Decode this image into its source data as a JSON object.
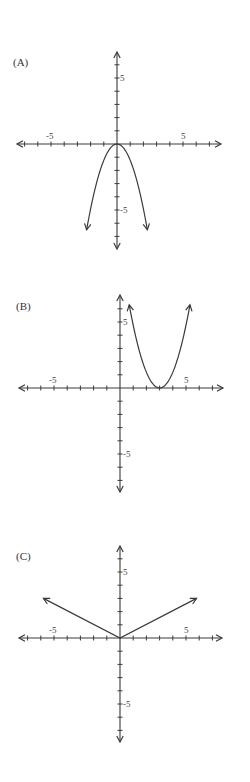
{
  "page": {
    "background": "#ffffff",
    "ink": "#3a3a3a"
  },
  "graphs": [
    {
      "label": "(A)",
      "id": "A"
    },
    {
      "label": "(B)",
      "id": "B"
    },
    {
      "label": "(C)",
      "id": "C"
    }
  ],
  "tick_labels": {
    "pos": "5",
    "neg": "-5"
  },
  "chart_data": [
    {
      "type": "line",
      "title": "(A)",
      "description": "Downward-opening parabola, vertex at origin",
      "equation_estimate": "y = -1.2x^2",
      "vertex": [
        0,
        0
      ],
      "endpoints": [
        [
          -2.3,
          -6.5
        ],
        [
          2.3,
          -6.5
        ]
      ],
      "x": [
        -2.3,
        -2,
        -1.5,
        -1,
        -0.5,
        0,
        0.5,
        1,
        1.5,
        2,
        2.3
      ],
      "y": [
        -6.5,
        -4.9,
        -2.7,
        -1.2,
        -0.3,
        0,
        -0.3,
        -1.2,
        -2.7,
        -4.9,
        -6.5
      ],
      "xlim": [
        -8,
        8
      ],
      "ylim": [
        -8,
        8
      ],
      "xticks": [
        -5,
        5
      ],
      "yticks": [
        5,
        -5
      ],
      "grid": false,
      "arrows_at_ends": true
    },
    {
      "type": "line",
      "title": "(B)",
      "description": "Upward-opening parabola, vertex at (3, 0)",
      "equation_estimate": "y = (x-3)^2 * 1.2",
      "vertex": [
        3,
        0
      ],
      "endpoints": [
        [
          0.7,
          6.3
        ],
        [
          5.3,
          6.3
        ]
      ],
      "x": [
        0.7,
        1,
        1.5,
        2,
        2.5,
        3,
        3.5,
        4,
        4.5,
        5,
        5.3
      ],
      "y": [
        6.3,
        4.8,
        2.7,
        1.2,
        0.3,
        0,
        0.3,
        1.2,
        2.7,
        4.8,
        6.3
      ],
      "xlim": [
        -8,
        8
      ],
      "ylim": [
        -8,
        8
      ],
      "xticks": [
        -5,
        5
      ],
      "yticks": [
        5,
        -5
      ],
      "grid": false,
      "arrows_at_ends": true
    },
    {
      "type": "line",
      "title": "(C)",
      "description": "Absolute value V-shape, vertex at origin",
      "equation_estimate": "y = 0.5|x|",
      "vertex": [
        0,
        0
      ],
      "endpoints": [
        [
          -5.8,
          3
        ],
        [
          5.8,
          3
        ]
      ],
      "x": [
        -5.8,
        0,
        5.8
      ],
      "y": [
        3,
        0,
        3
      ],
      "xlim": [
        -8,
        8
      ],
      "ylim": [
        -8,
        8
      ],
      "xticks": [
        -5,
        5
      ],
      "yticks": [
        5,
        -5
      ],
      "grid": false,
      "arrows_at_ends": true
    }
  ]
}
